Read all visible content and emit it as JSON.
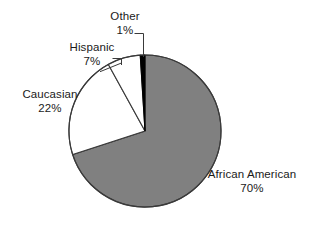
{
  "chart_data": {
    "type": "pie",
    "title": "",
    "subtitle": "",
    "xlabel": "",
    "ylabel": "",
    "legend_position": "none",
    "grid": false,
    "units": "percent",
    "total": 100,
    "start_angle_deg": 0,
    "direction": "clockwise",
    "categories": [
      "African American",
      "Caucasian",
      "Hispanic",
      "Other"
    ],
    "values": [
      70,
      22,
      7,
      1
    ],
    "slices": [
      {
        "label": "African American",
        "value": 70,
        "value_text": "70%",
        "color": "#808080",
        "start_angle_deg": 0,
        "end_angle_deg": 252,
        "label_position": "bottom-right",
        "leader_line": false
      },
      {
        "label": "Caucasian",
        "value": 22,
        "value_text": "22%",
        "color": "#ffffff",
        "start_angle_deg": 252,
        "end_angle_deg": 331.2,
        "label_position": "left",
        "leader_line": false
      },
      {
        "label": "Hispanic",
        "value": 7,
        "value_text": "7%",
        "color": "#ffffff",
        "start_angle_deg": 331.2,
        "end_angle_deg": 356.4,
        "label_position": "upper-left",
        "leader_line": true
      },
      {
        "label": "Other",
        "value": 1,
        "value_text": "1%",
        "color": "#000000",
        "start_angle_deg": 356.4,
        "end_angle_deg": 360,
        "label_position": "top",
        "leader_line": true
      }
    ],
    "colors": {
      "african_american": "#808080",
      "caucasian": "#ffffff",
      "hispanic": "#ffffff",
      "other": "#000000",
      "outline": "#3a3a3a",
      "background": "#ffffff",
      "text": "#1a1a1a"
    },
    "geometry": {
      "center_x": 145,
      "center_y": 131,
      "radius": 76
    }
  },
  "labels": {
    "other": {
      "name": "Other",
      "value": "1%"
    },
    "hispanic": {
      "name": "Hispanic",
      "value": "7%"
    },
    "caucasian": {
      "name": "Caucasian",
      "value": "22%"
    },
    "african_american": {
      "name": "African American",
      "value": "70%"
    }
  }
}
